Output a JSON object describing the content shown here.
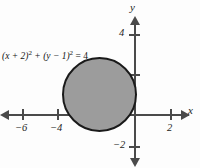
{
  "figure": {
    "type": "coordinate-plane-graph",
    "background_color": "#fdfdfd",
    "axis_color": "#4a4a4a",
    "curve_color": "#1a1a1a",
    "fill_color": "#9c9c9c",
    "equation_parts": {
      "lead": "(x + 2)",
      "exp1": "2",
      "mid": " + (y − 1)",
      "exp2": "2",
      "tail": " = 4"
    },
    "equation_text": "(x + 2)² + (y − 1)² = 4"
  },
  "axes": {
    "x_name": "x",
    "y_name": "y",
    "x_labels": [
      "−6",
      "−4",
      "2"
    ],
    "y_labels": [
      "4",
      "−2"
    ]
  },
  "chart_data": {
    "type": "scatter",
    "title": "",
    "subtitle": "",
    "xlabel": "x",
    "ylabel": "y",
    "xlim": [
      -7.4,
      3.1
    ],
    "ylim": [
      -3.2,
      4.6
    ],
    "grid": false,
    "legend": "none",
    "x_ticks": [
      -6,
      -4,
      -2,
      2
    ],
    "x_tick_labels": [
      "−6",
      "−4",
      "",
      "2"
    ],
    "y_ticks": [
      4,
      2,
      -2
    ],
    "y_tick_labels": [
      "4",
      "",
      "−2"
    ],
    "annotations": [
      {
        "text": "(x + 2)² + (y − 1)² = 4",
        "x": -5.5,
        "y": 3.0
      }
    ],
    "series": [
      {
        "name": "(x + 2)² + (y − 1)² = 4",
        "shape": "circle",
        "center": [
          -2,
          1
        ],
        "radius": 2,
        "filled": true,
        "fill": "#9c9c9c",
        "stroke": "#1a1a1a",
        "equation": "(x + 2)² + (y − 1)² = 4"
      }
    ]
  }
}
